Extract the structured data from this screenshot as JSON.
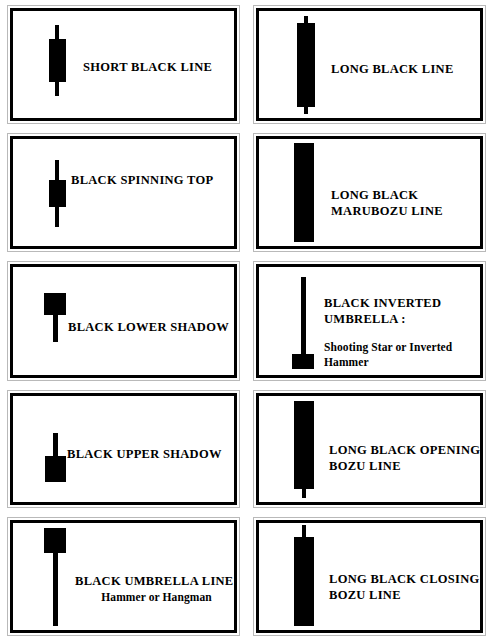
{
  "figure": {
    "type": "candlestick-reference-chart",
    "columns": 2,
    "rows": 5,
    "ink_color": "#000000",
    "background_color": "#ffffff",
    "frame_color": "#000000",
    "outer_rule_color": "#b9b9b9"
  },
  "cells": [
    {
      "id": "short-black-line",
      "title": "SHORT BLACK LINE",
      "subtitle": "",
      "candle": {
        "pattern": "short-black-line",
        "body_top_pct": 26,
        "body_height_pct": 40,
        "body_width_px": 17,
        "upper_wick_pct": 13,
        "lower_wick_pct": 13,
        "center_x_px": 44
      }
    },
    {
      "id": "long-black-line",
      "title": "LONG BLACK LINE",
      "subtitle": "",
      "candle": {
        "pattern": "long-black-line",
        "body_top_pct": 11,
        "body_height_pct": 79,
        "body_width_px": 18,
        "upper_wick_pct": 6,
        "lower_wick_pct": 6,
        "center_x_px": 47
      }
    },
    {
      "id": "black-spinning-top",
      "title": "BLACK SPINNING TOP",
      "subtitle": "",
      "candle": {
        "pattern": "black-spinning-top",
        "body_top_pct": 38,
        "body_height_pct": 26,
        "body_width_px": 17,
        "upper_wick_pct": 18,
        "lower_wick_pct": 18,
        "center_x_px": 44
      }
    },
    {
      "id": "long-black-marubozu-line",
      "title": "LONG BLACK\nMARUBOZU LINE",
      "subtitle": "",
      "candle": {
        "pattern": "long-black-marubozu-line",
        "body_top_pct": 4,
        "body_height_pct": 92,
        "body_width_px": 20,
        "upper_wick_pct": 0,
        "lower_wick_pct": 0,
        "center_x_px": 45
      }
    },
    {
      "id": "black-lower-shadow",
      "title": "BLACK LOWER SHADOW",
      "subtitle": "",
      "candle": {
        "pattern": "black-lower-shadow",
        "body_top_pct": 24,
        "body_height_pct": 20,
        "body_width_px": 22,
        "upper_wick_pct": 0,
        "lower_wick_pct": 25,
        "center_x_px": 42
      }
    },
    {
      "id": "black-inverted-umbrella",
      "title": "BLACK  INVERTED\nUMBRELLA :",
      "subtitle": "Shooting Star or Inverted\nHammer",
      "candle": {
        "pattern": "black-inverted-umbrella",
        "body_top_pct": 81,
        "body_height_pct": 13,
        "body_width_px": 22,
        "upper_wick_pct": 72,
        "lower_wick_pct": 0,
        "center_x_px": 44
      }
    },
    {
      "id": "black-upper-shadow",
      "title": "BLACK UPPER SHADOW",
      "subtitle": "",
      "candle": {
        "pattern": "black-upper-shadow",
        "body_top_pct": 57,
        "body_height_pct": 24,
        "body_width_px": 21,
        "upper_wick_pct": 22,
        "lower_wick_pct": 0,
        "center_x_px": 42
      }
    },
    {
      "id": "long-black-opening-bozu-line",
      "title": "LONG BLACK OPENING\nBOZU LINE",
      "subtitle": "",
      "candle": {
        "pattern": "long-black-opening-bozu-line",
        "body_top_pct": 5,
        "body_height_pct": 83,
        "body_width_px": 20,
        "upper_wick_pct": 0,
        "lower_wick_pct": 8,
        "center_x_px": 45
      }
    },
    {
      "id": "black-umbrella-line",
      "title": "BLACK UMBRELLA LINE:",
      "subtitle": "Hammer or Hangman",
      "candle": {
        "pattern": "black-umbrella-line",
        "body_top_pct": 5,
        "body_height_pct": 23,
        "body_width_px": 22,
        "upper_wick_pct": 0,
        "lower_wick_pct": 68,
        "center_x_px": 42
      }
    },
    {
      "id": "long-black-closing-bozu-line",
      "title": "LONG BLACK CLOSING\nBOZU LINE",
      "subtitle": "",
      "candle": {
        "pattern": "long-black-closing-bozu-line",
        "body_top_pct": 13,
        "body_height_pct": 83,
        "body_width_px": 20,
        "upper_wick_pct": 11,
        "lower_wick_pct": 0,
        "center_x_px": 45
      }
    }
  ]
}
